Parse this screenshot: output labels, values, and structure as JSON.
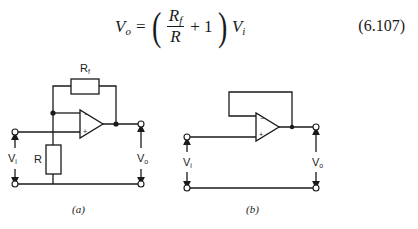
{
  "equation": {
    "lhs": "V",
    "lhs_sub": "o",
    "equals": "=",
    "frac_num": "R",
    "frac_num_sub": "f",
    "frac_den": "R",
    "plus": "+ 1",
    "rhs": "V",
    "rhs_sub": "i",
    "number": "(6.107)"
  },
  "figure_a": {
    "feedback_resistor_label": "R",
    "feedback_resistor_sub": "f",
    "ground_resistor_label": "R",
    "input_label": "V",
    "input_sub": "i",
    "output_label": "V",
    "output_sub": "o",
    "minus_sign": "−",
    "plus_sign": "+",
    "caption": "(a)"
  },
  "figure_b": {
    "input_label": "V",
    "input_sub": "i",
    "output_label": "V",
    "output_sub": "o",
    "minus_sign": "−",
    "plus_sign": "+",
    "caption": "(b)"
  },
  "colors": {
    "line": "#1a1a1a",
    "background": "#ffffff"
  }
}
